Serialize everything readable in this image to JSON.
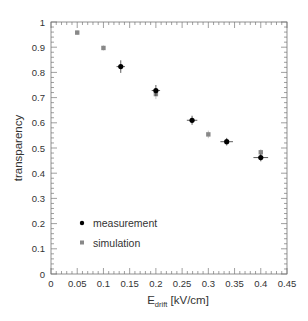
{
  "chart_data": {
    "type": "scatter",
    "title": "",
    "xlabel": "E_drift [kV/cm]",
    "xlabel_main": "E",
    "xlabel_sub": "drift",
    "xlabel_unit": " [kV/cm]",
    "ylabel": "transparency",
    "xlim": [
      0,
      0.45
    ],
    "ylim": [
      0,
      1
    ],
    "xticks": [
      "0",
      "0.05",
      "0.1",
      "0.15",
      "0.2",
      "0.25",
      "0.3",
      "0.35",
      "0.4",
      "0.45"
    ],
    "yticks": [
      "0",
      "0.1",
      "0.2",
      "0.3",
      "0.4",
      "0.5",
      "0.6",
      "0.7",
      "0.8",
      "0.9",
      "1"
    ],
    "grid": false,
    "legend_position": "lower left",
    "series": [
      {
        "name": "measurement",
        "color": "#000000",
        "marker": "circle",
        "points": [
          {
            "x": 0.133,
            "y": 0.823,
            "xerr": 0.008,
            "yerr": 0.025
          },
          {
            "x": 0.2,
            "y": 0.728,
            "xerr": 0.008,
            "yerr": 0.022
          },
          {
            "x": 0.269,
            "y": 0.61,
            "xerr": 0.01,
            "yerr": 0.018
          },
          {
            "x": 0.335,
            "y": 0.525,
            "xerr": 0.012,
            "yerr": 0.015
          },
          {
            "x": 0.4,
            "y": 0.462,
            "xerr": 0.014,
            "yerr": 0.015
          }
        ]
      },
      {
        "name": "simulation",
        "color": "#888888",
        "marker": "square",
        "points": [
          {
            "x": 0.05,
            "y": 0.958,
            "yerr": 0.008
          },
          {
            "x": 0.1,
            "y": 0.897,
            "yerr": 0.01
          },
          {
            "x": 0.2,
            "y": 0.714,
            "yerr": 0.02
          },
          {
            "x": 0.3,
            "y": 0.554,
            "yerr": 0.015
          },
          {
            "x": 0.4,
            "y": 0.483,
            "yerr": 0.012
          }
        ]
      }
    ]
  }
}
